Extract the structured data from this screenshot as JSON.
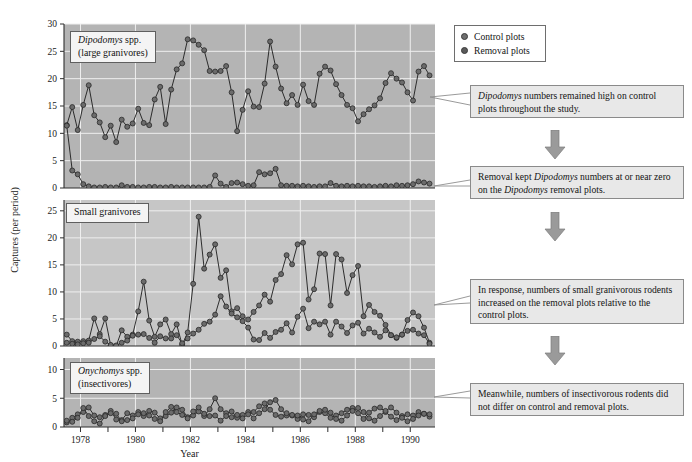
{
  "figure": {
    "x_axis_label": "Year",
    "y_axis_label": "Captures (per period)",
    "x_ticks_major": [
      "1978",
      "1980",
      "1982",
      "1984",
      "1986",
      "1988",
      "1990"
    ],
    "x_range": [
      1977.4,
      1990.9
    ]
  },
  "legend": {
    "items": [
      {
        "label": "Control plots",
        "color": "#6e6e6e"
      },
      {
        "label": "Removal plots",
        "color": "#5a5a5a"
      }
    ]
  },
  "panels": [
    {
      "id": "panel-dipodomys",
      "title_line1": "Dipodomys spp.",
      "title_line2": "(large granivores)",
      "title_italic_part": "Dipodomys",
      "y_ticks": [
        0,
        5,
        10,
        15,
        20,
        25,
        30
      ],
      "ylim": [
        0,
        30
      ]
    },
    {
      "id": "panel-small-granivores",
      "title_line1": "Small granivores",
      "title_line2": "",
      "title_italic_part": "",
      "y_ticks": [
        0,
        5,
        10,
        15,
        20,
        25
      ],
      "ylim": [
        0,
        27
      ]
    },
    {
      "id": "panel-onychomys",
      "title_line1": "Onychomys spp.",
      "title_line2": "(insectivores)",
      "title_italic_part": "Onychomys",
      "y_ticks": [
        0,
        5,
        10
      ],
      "ylim": [
        0,
        12
      ]
    }
  ],
  "callouts": [
    {
      "id": "callout-1",
      "text": "Dipodomys numbers remained high on control plots throughout the study.",
      "italic_prefix": "Dipodomys",
      "rest": " numbers remained high on control plots throughout the study."
    },
    {
      "id": "callout-2",
      "text": "Removal kept Dipodomys numbers at or near zero on the Dipodomys removal plots.",
      "parts": [
        "Removal kept ",
        "Dipodomys",
        " numbers at or near zero on the ",
        "Dipodomys",
        " removal plots."
      ]
    },
    {
      "id": "callout-3",
      "text": "In response, numbers of small granivorous rodents increased on the removal plots relative to the control plots."
    },
    {
      "id": "callout-4",
      "text": "Meanwhile, numbers of insectivorous rodents did not differ on control and removal plots."
    }
  ],
  "colors": {
    "panel_background": "#b4b4b4",
    "panel_background_mid": "#c6c6c6",
    "gridline": "#efefef",
    "series_line": "#1c1c1c",
    "marker_fill": "#6b6b6b",
    "marker_stroke": "#2a2a2a",
    "callout_fill": "#e8e8e8",
    "callout_border": "#8a8a8a",
    "arrow_fill": "#9a9a9a"
  },
  "chart_data": {
    "type": "line",
    "title": "",
    "xlabel": "Year",
    "ylabel": "Captures (per period)",
    "grid": true,
    "legend_position": "top-right-outside",
    "panels": [
      {
        "name": "Dipodomys spp. (large granivores)",
        "ylim": [
          0,
          30
        ],
        "yticks": [
          0,
          5,
          10,
          15,
          20,
          25,
          30
        ],
        "x": [
          1977.5,
          1977.7,
          1977.9,
          1978.1,
          1978.3,
          1978.5,
          1978.7,
          1978.9,
          1979.1,
          1979.3,
          1979.5,
          1979.7,
          1979.9,
          1980.1,
          1980.3,
          1980.5,
          1980.7,
          1980.9,
          1981.1,
          1981.3,
          1981.5,
          1981.7,
          1981.9,
          1982.1,
          1982.3,
          1982.5,
          1982.7,
          1982.9,
          1983.1,
          1983.3,
          1983.5,
          1983.7,
          1983.9,
          1984.1,
          1984.3,
          1984.5,
          1984.7,
          1984.9,
          1985.1,
          1985.3,
          1985.5,
          1985.7,
          1985.9,
          1986.1,
          1986.3,
          1986.5,
          1986.7,
          1986.9,
          1987.1,
          1987.3,
          1987.5,
          1987.7,
          1987.9,
          1988.1,
          1988.3,
          1988.5,
          1988.7,
          1988.9,
          1989.1,
          1989.3,
          1989.5,
          1989.7,
          1989.9,
          1990.1,
          1990.3,
          1990.5,
          1990.7
        ],
        "series": [
          {
            "name": "Control plots",
            "values": [
              11.5,
              14.8,
              10.6,
              15.2,
              18.8,
              13.3,
              12.0,
              9.3,
              11.4,
              8.4,
              12.5,
              11.2,
              11.8,
              14.5,
              11.9,
              11.5,
              16.2,
              18.5,
              11.7,
              18.0,
              21.7,
              22.8,
              27.2,
              27.0,
              26.2,
              25.2,
              21.4,
              21.3,
              21.4,
              22.3,
              17.5,
              10.4,
              14.3,
              17.7,
              14.9,
              14.8,
              19.1,
              26.8,
              22.2,
              18.2,
              15.5,
              17.0,
              15.2,
              18.9,
              15.9,
              15.2,
              20.9,
              22.2,
              21.5,
              19.0,
              17.0,
              15.2,
              14.6,
              12.2,
              13.5,
              14.4,
              15.1,
              16.4,
              19.2,
              21.0,
              20.0,
              19.3,
              17.5,
              16.0,
              21.3,
              22.3,
              20.6
            ]
          },
          {
            "name": "Removal plots",
            "values": [
              11.4,
              3.2,
              2.5,
              0.7,
              0.3,
              0.1,
              0.1,
              0.2,
              0.1,
              0.1,
              0.5,
              0.2,
              0.2,
              0.1,
              0.1,
              0.2,
              0.2,
              0.1,
              0.1,
              0.2,
              0.1,
              0.1,
              0.1,
              0.1,
              0.1,
              0.1,
              0.2,
              2.3,
              0.8,
              0.2,
              0.9,
              1.0,
              0.7,
              0.4,
              0.5,
              2.9,
              2.5,
              2.7,
              3.5,
              0.5,
              0.4,
              0.4,
              0.3,
              0.4,
              0.3,
              0.2,
              0.3,
              0.3,
              0.9,
              0.4,
              0.3,
              0.4,
              0.3,
              0.4,
              0.3,
              0.3,
              0.2,
              0.3,
              0.4,
              0.3,
              0.5,
              0.4,
              0.5,
              0.7,
              1.2,
              1.0,
              0.8
            ]
          }
        ]
      },
      {
        "name": "Small granivores",
        "ylim": [
          0,
          27
        ],
        "yticks": [
          0,
          5,
          10,
          15,
          20,
          25
        ],
        "x": [
          1977.5,
          1977.7,
          1977.9,
          1978.1,
          1978.3,
          1978.5,
          1978.7,
          1978.9,
          1979.1,
          1979.3,
          1979.5,
          1979.7,
          1979.9,
          1980.1,
          1980.3,
          1980.5,
          1980.7,
          1980.9,
          1981.1,
          1981.3,
          1981.5,
          1981.7,
          1981.9,
          1982.1,
          1982.3,
          1982.5,
          1982.7,
          1982.9,
          1983.1,
          1983.3,
          1983.5,
          1983.7,
          1983.9,
          1984.1,
          1984.3,
          1984.5,
          1984.7,
          1984.9,
          1985.1,
          1985.3,
          1985.5,
          1985.7,
          1985.9,
          1986.1,
          1986.3,
          1986.5,
          1986.7,
          1986.9,
          1987.1,
          1987.3,
          1987.5,
          1987.7,
          1987.9,
          1988.1,
          1988.3,
          1988.5,
          1988.7,
          1988.9,
          1989.1,
          1989.3,
          1989.5,
          1989.7,
          1989.9,
          1990.1,
          1990.3,
          1990.5,
          1990.7
        ],
        "series": [
          {
            "name": "Removal plots",
            "values": [
              2.1,
              0.9,
              0.8,
              0.9,
              1.0,
              5.1,
              2.2,
              5.1,
              0.1,
              0.0,
              2.9,
              1.7,
              2.1,
              6.4,
              11.9,
              4.7,
              1.7,
              4.0,
              4.9,
              2.2,
              4.0,
              0.2,
              2.5,
              11.5,
              23.9,
              14.3,
              16.9,
              18.8,
              12.6,
              14.0,
              6.4,
              7.0,
              5.5,
              4.9,
              6.3,
              7.5,
              9.5,
              8.2,
              12.2,
              13.3,
              16.8,
              15.1,
              18.8,
              19.1,
              8.6,
              10.5,
              17.1,
              17.0,
              7.5,
              17.0,
              16.0,
              9.8,
              13.1,
              14.8,
              5.5,
              7.6,
              6.3,
              5.6,
              3.9,
              2.0,
              1.5,
              2.1,
              4.8,
              6.2,
              5.5,
              3.4,
              0.6
            ]
          },
          {
            "name": "Control plots",
            "values": [
              0.6,
              0.4,
              0.3,
              0.5,
              0.6,
              1.3,
              1.8,
              0.8,
              0.2,
              0.1,
              0.6,
              1.0,
              1.9,
              2.1,
              2.2,
              1.5,
              0.6,
              1.8,
              1.4,
              1.4,
              2.0,
              0.5,
              1.4,
              2.3,
              3.0,
              4.1,
              4.5,
              5.8,
              9.2,
              7.3,
              6.0,
              5.3,
              4.6,
              3.4,
              1.2,
              1.1,
              2.4,
              1.5,
              2.6,
              3.0,
              4.2,
              2.5,
              5.4,
              6.9,
              3.3,
              4.5,
              4.0,
              4.5,
              2.1,
              4.5,
              3.6,
              2.4,
              3.8,
              4.3,
              2.3,
              3.2,
              2.5,
              1.7,
              2.9,
              2.0,
              1.6,
              2.1,
              2.8,
              3.0,
              2.3,
              2.0,
              0.4
            ]
          }
        ]
      },
      {
        "name": "Onychomys spp. (insectivores)",
        "ylim": [
          0,
          12
        ],
        "yticks": [
          0,
          5,
          10
        ],
        "x": [
          1977.5,
          1977.7,
          1977.9,
          1978.1,
          1978.3,
          1978.5,
          1978.7,
          1978.9,
          1979.1,
          1979.3,
          1979.5,
          1979.7,
          1979.9,
          1980.1,
          1980.3,
          1980.5,
          1980.7,
          1980.9,
          1981.1,
          1981.3,
          1981.5,
          1981.7,
          1981.9,
          1982.1,
          1982.3,
          1982.5,
          1982.7,
          1982.9,
          1983.1,
          1983.3,
          1983.5,
          1983.7,
          1983.9,
          1984.1,
          1984.3,
          1984.5,
          1984.7,
          1984.9,
          1985.1,
          1985.3,
          1985.5,
          1985.7,
          1985.9,
          1986.1,
          1986.3,
          1986.5,
          1986.7,
          1986.9,
          1987.1,
          1987.3,
          1987.5,
          1987.7,
          1987.9,
          1988.1,
          1988.3,
          1988.5,
          1988.7,
          1988.9,
          1989.1,
          1989.3,
          1989.5,
          1989.7,
          1989.9,
          1990.1,
          1990.3,
          1990.5,
          1990.7
        ],
        "series": [
          {
            "name": "Control plots",
            "values": [
              0.8,
              1.6,
              2.2,
              2.6,
              3.4,
              2.0,
              1.7,
              2.1,
              2.8,
              1.3,
              1.2,
              2.4,
              2.0,
              2.6,
              1.9,
              2.8,
              2.5,
              1.5,
              1.9,
              2.5,
              3.4,
              3.0,
              1.7,
              2.0,
              2.7,
              1.9,
              3.1,
              5.0,
              3.1,
              2.4,
              2.7,
              1.6,
              2.1,
              2.6,
              1.5,
              2.4,
              3.1,
              4.3,
              4.7,
              3.1,
              2.0,
              2.0,
              1.4,
              2.2,
              2.1,
              1.7,
              2.6,
              2.4,
              1.6,
              2.0,
              2.4,
              3.0,
              3.3,
              2.4,
              1.4,
              2.5,
              3.2,
              3.4,
              2.6,
              1.8,
              1.2,
              1.9,
              2.2,
              2.0,
              2.6,
              2.3,
              1.8
            ]
          },
          {
            "name": "Removal plots",
            "values": [
              1.1,
              0.9,
              1.6,
              3.3,
              1.9,
              1.0,
              0.6,
              1.9,
              2.4,
              2.3,
              1.0,
              1.2,
              1.5,
              2.2,
              2.4,
              2.0,
              1.4,
              1.0,
              2.6,
              3.5,
              2.6,
              2.1,
              1.5,
              2.7,
              3.4,
              2.3,
              1.9,
              2.0,
              1.1,
              1.9,
              1.7,
              2.1,
              1.5,
              2.2,
              2.6,
              3.6,
              4.1,
              3.0,
              2.1,
              1.8,
              2.4,
              2.1,
              2.0,
              1.3,
              1.0,
              2.2,
              2.8,
              3.0,
              2.5,
              1.4,
              1.1,
              2.0,
              2.8,
              3.3,
              2.6,
              1.5,
              1.1,
              1.9,
              2.8,
              3.4,
              2.5,
              1.6,
              1.0,
              1.4,
              2.0,
              2.3,
              2.2
            ]
          }
        ]
      }
    ]
  }
}
